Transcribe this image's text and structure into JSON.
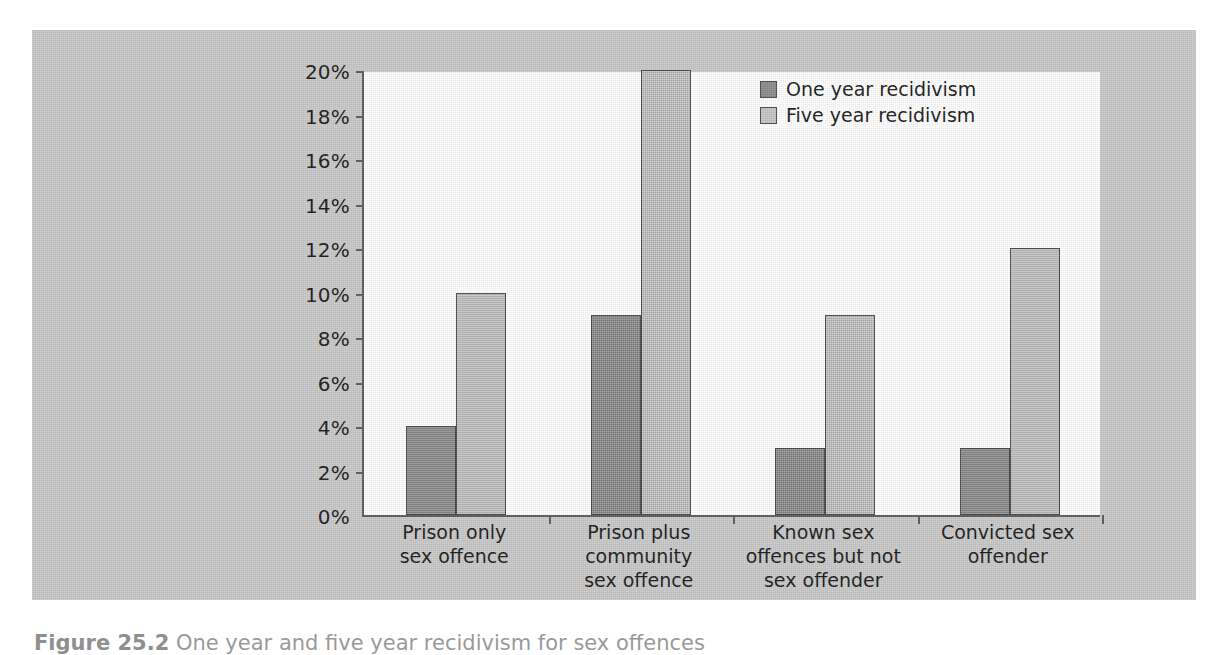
{
  "chart_data": {
    "type": "bar",
    "title": "",
    "xlabel": "",
    "ylabel": "",
    "ylim": [
      0,
      20
    ],
    "grid": false,
    "legend_position": "top-right",
    "y_tick_labels": [
      "0%",
      "2%",
      "4%",
      "6%",
      "8%",
      "10%",
      "12%",
      "14%",
      "16%",
      "18%",
      "20%"
    ],
    "y_tick_values": [
      0,
      2,
      4,
      6,
      8,
      10,
      12,
      14,
      16,
      18,
      20
    ],
    "categories": [
      "Prison only\nsex offence",
      "Prison plus\ncommunity\nsex offence",
      "Known sex\noffences but not\nsex offender",
      "Convicted sex\noffender"
    ],
    "series": [
      {
        "name": "One year recidivism",
        "color": "#8d8d8d",
        "values": [
          4,
          9,
          3,
          3
        ]
      },
      {
        "name": "Five year recidivism",
        "color": "#c6c6c6",
        "values": [
          10,
          20,
          9,
          12
        ]
      }
    ],
    "units": "percent"
  },
  "legend": {
    "items": [
      {
        "label": "One year recidivism"
      },
      {
        "label": "Five year recidivism"
      }
    ]
  },
  "caption": {
    "number": "Figure 25.2",
    "text": "One year and five year recidivism for sex offences"
  },
  "colors": {
    "panel_background": "#c9c9c9",
    "plot_background": "#ffffff",
    "axis": "#5d5d5d",
    "series_one": "#8d8d8d",
    "series_five": "#c6c6c6",
    "text": "#1c1c1c"
  }
}
